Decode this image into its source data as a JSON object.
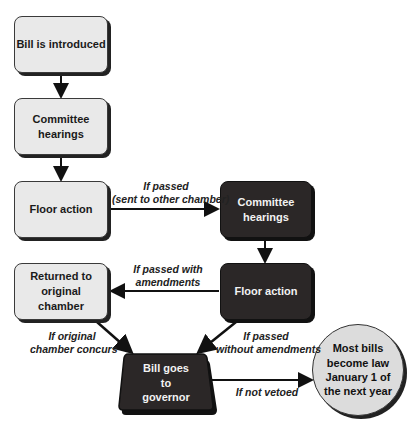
{
  "diagram": {
    "nodes": {
      "bill_introduced": "Bill is introduced",
      "committee_hearings_1": "Committee hearings",
      "floor_action_1": "Floor action",
      "committee_hearings_2": "Committee hearings",
      "floor_action_2": "Floor action",
      "returned_original": "Returned to original chamber",
      "goes_to_governor": "Bill goes to governor",
      "becomes_law": "Most bills become law January 1 of the next year"
    },
    "edge_labels": {
      "sent_other_line1": "If passed",
      "sent_other_line2": "(sent to other chamber)",
      "with_amend_line1": "If passed with",
      "with_amend_line2": "amendments",
      "concurs_line1": "If original",
      "concurs_line2": "chamber concurs",
      "without_amend_line1": "If passed",
      "without_amend_line2": "without amendments",
      "not_vetoed": "If not vetoed"
    },
    "colors": {
      "light_fill": "#e9e9e9",
      "dark_fill": "#2b2727",
      "circle_fill": "#dcdcdc",
      "line": "#111111"
    }
  }
}
